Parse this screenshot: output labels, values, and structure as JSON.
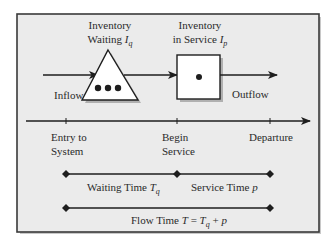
{
  "diagram": {
    "type": "process-flow-timeline",
    "colors": {
      "frame_bg": "#ebebeb",
      "frame_border": "#3a3a3a",
      "shadow": "#b5b5b5",
      "stroke": "#1e1e1e",
      "shape_fill": "#ffffff",
      "text": "#2a2a2a"
    },
    "flow": {
      "inflow_label": "Inflow",
      "outflow_label": "Outflow",
      "queue": {
        "shape": "triangle",
        "title_line1": "Inventory",
        "title_line2_prefix": "Waiting ",
        "symbol": "I",
        "symbol_sub": "q",
        "dot_count": 3
      },
      "server": {
        "shape": "square",
        "title_line1": "Inventory",
        "title_line2_prefix": "in Service ",
        "symbol": "I",
        "symbol_sub": "p",
        "dot_count": 1
      }
    },
    "timeline": {
      "events": [
        {
          "line1": "Entry to",
          "line2": "System"
        },
        {
          "line1": "Begin",
          "line2": "Service"
        },
        {
          "line1": "Departure",
          "line2": ""
        }
      ]
    },
    "intervals": {
      "waiting": {
        "prefix": "Waiting Time ",
        "symbol": "T",
        "sub": "q"
      },
      "service": {
        "prefix": "Service Time ",
        "symbol": "p"
      },
      "flow": {
        "prefix": "Flow Time ",
        "symbol": "T",
        "equals": " = ",
        "term1": "T",
        "term1_sub": "q",
        "plus": " + ",
        "term2": "p"
      }
    }
  }
}
